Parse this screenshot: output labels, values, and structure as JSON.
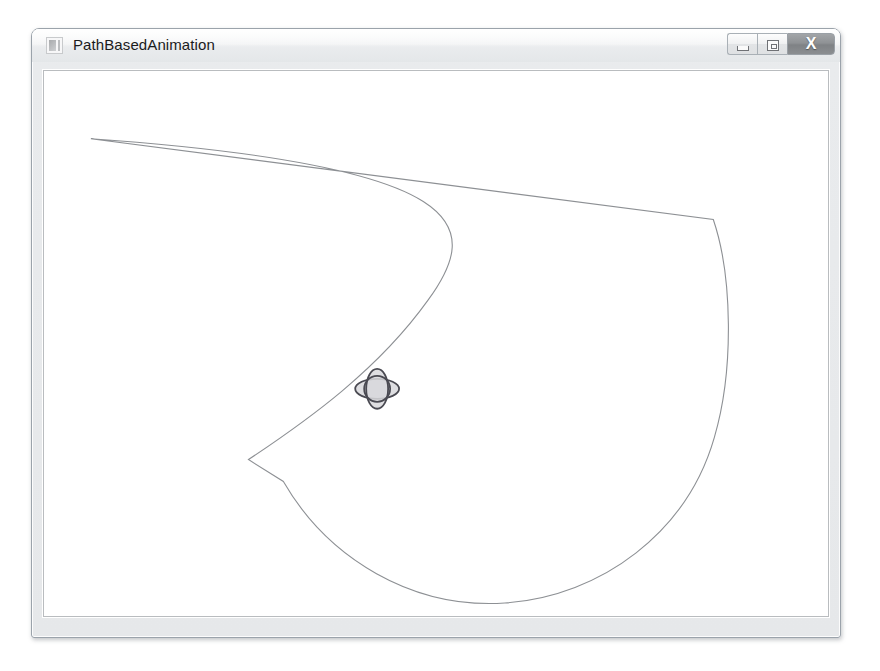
{
  "window": {
    "title": "PathBasedAnimation",
    "icon": "application-window-icon",
    "frame_color": "#e6e8ea",
    "border_color": "#9ba3ab",
    "client_background": "#ffffff"
  },
  "caption_buttons": [
    {
      "name": "minimize-button",
      "label": "",
      "glyph": "minimize-glyph"
    },
    {
      "name": "maximize-button",
      "label": "",
      "glyph": "maximize-glyph"
    },
    {
      "name": "close-button",
      "label": "X",
      "glyph": "close-glyph"
    }
  ],
  "canvas": {
    "name": "animation-canvas",
    "stroke_color": "#8d9094",
    "stroke_width": 1,
    "view_box": "0 0 786 547",
    "path_geometry": {
      "description": "pie/pac-man-like figure: straight line from cusp to upper-right corner, large outer arc sweeping down and around, inner arc returning to the cusp",
      "cusp_point": [
        47,
        68
      ],
      "upper_right_corner": [
        671,
        149
      ],
      "inner_corner": [
        205,
        390
      ],
      "outer_arc_right_extreme": [
        685,
        330
      ],
      "outer_arc_bottom_extreme": [
        430,
        535
      ],
      "d": "M 47 68 L 671 149 C 690 205 692 300 672 368 C 645 462 560 527 462 534 C 370 540 285 490 240 412 L 205 390 C 265 350 335 300 385 230 C 440 155 430 95 47 68 Z"
    },
    "moving_object": {
      "name": "animated-sprite",
      "shape": "four-petal atom / flower of crossed ellipses with center circle",
      "center": [
        334,
        319
      ],
      "radius_x": 22,
      "radius_y": 20,
      "stroke_color": "#4a4a52",
      "fill_color": "#d8d8dc"
    }
  }
}
